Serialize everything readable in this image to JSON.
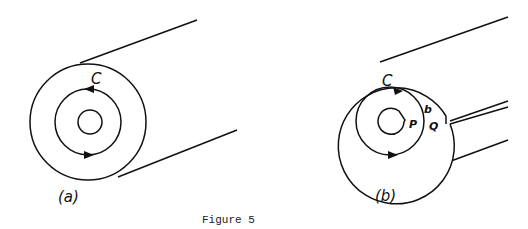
{
  "figure": {
    "caption": "Figure 5",
    "panels": [
      {
        "id": "a",
        "label": "(a)",
        "contour_label": "C",
        "description": "Solid cylinder cross-section with closed contour C around hollow core"
      },
      {
        "id": "b",
        "label": "(b)",
        "contour_label": "C",
        "point_labels": {
          "p": "P",
          "q": "Q",
          "b": "b"
        },
        "description": "Cylinder with slit cut from core to surface; contour C crosses slit between points P and Q"
      }
    ]
  },
  "colors": {
    "stroke": "#111111",
    "background": "#ffffff"
  }
}
